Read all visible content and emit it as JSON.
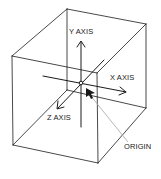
{
  "diagram": {
    "type": "3d-coordinate-cube",
    "labels": {
      "y_axis": "Y AXIS",
      "x_axis": "X AXIS",
      "z_axis": "Z AXIS",
      "origin": "ORIGIN"
    },
    "colors": {
      "line": "#1a1a1a",
      "leader": "#b0b0b0",
      "background": "#ffffff"
    }
  }
}
